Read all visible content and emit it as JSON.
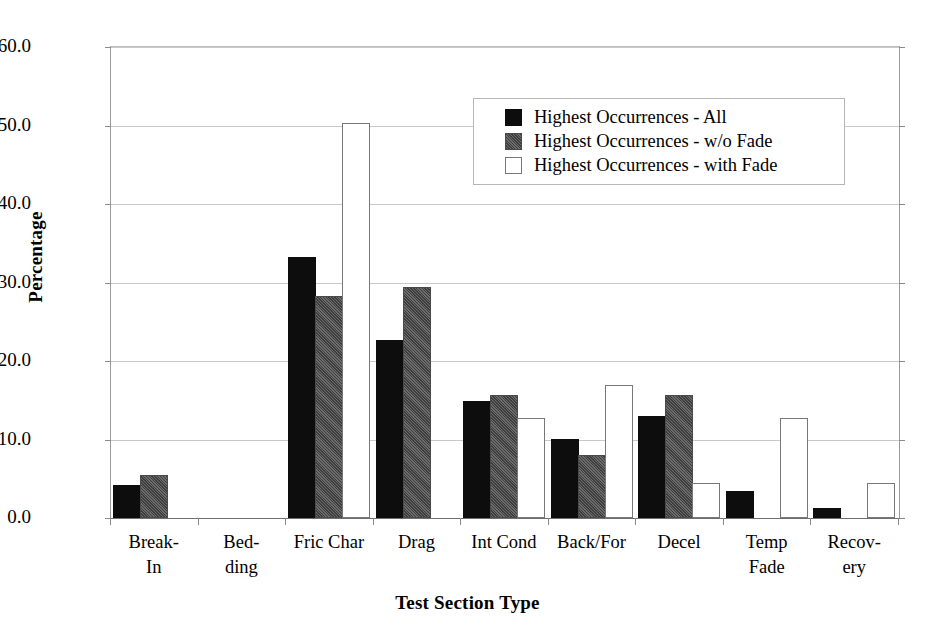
{
  "chart_data": {
    "type": "bar",
    "title": "",
    "xlabel": "Test Section Type",
    "ylabel": "Percentage",
    "ylim": [
      0,
      60
    ],
    "ytick_step": 10,
    "ytick_labels": [
      "0.0",
      "10.0",
      "20.0",
      "30.0",
      "40.0",
      "50.0",
      "60.0"
    ],
    "grid": true,
    "legend_position": "top-right",
    "categories": [
      "Break-\nIn",
      "Bed-\nding",
      "Fric Char",
      "Drag",
      "Int Cond",
      "Back/For",
      "Decel",
      "Temp\nFade",
      "Recov-\nery"
    ],
    "series": [
      {
        "name": "Highest Occurrences - All",
        "color": "#0d0d0d",
        "values": [
          4.0,
          0.0,
          33.0,
          22.4,
          14.6,
          9.8,
          12.7,
          3.2,
          1.0
        ]
      },
      {
        "name": "Highest Occurrences - w/o Fade",
        "color": "#585858",
        "values": [
          5.2,
          0.0,
          28.0,
          29.2,
          15.4,
          7.8,
          15.4,
          0.0,
          0.0
        ]
      },
      {
        "name": "Highest Occurrences - with Fade",
        "color": "#ffffff",
        "values": [
          0.0,
          0.0,
          50.1,
          0.0,
          12.5,
          16.7,
          4.2,
          12.5,
          4.2
        ]
      }
    ]
  },
  "legend": {
    "items": [
      "Highest Occurrences - All",
      "Highest Occurrences - w/o Fade",
      "Highest Occurrences - with Fade"
    ]
  }
}
